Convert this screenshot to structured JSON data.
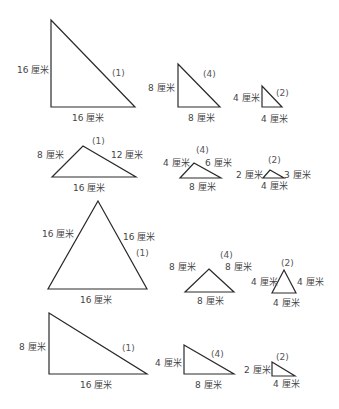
{
  "unit": "厘米",
  "rows": [
    {
      "name": "right-triangles-large",
      "triangles": [
        {
          "tag": "(1)",
          "points": "51,20 135,107 51,107",
          "labels": [
            {
              "text": "16 厘米",
              "x": 17,
              "y": 73
            },
            {
              "text": "16 厘米",
              "x": 72,
              "y": 121
            },
            {
              "text": "(1)",
              "x": 112,
              "y": 76,
              "kind": "tag"
            }
          ]
        },
        {
          "tag": "(4)",
          "points": "178,64 220,107 178,107",
          "labels": [
            {
              "text": "8 厘米",
              "x": 148,
              "y": 91
            },
            {
              "text": "8 厘米",
              "x": 188,
              "y": 121
            },
            {
              "text": "(4)",
              "x": 203,
              "y": 77,
              "kind": "tag"
            }
          ]
        },
        {
          "tag": "(2)",
          "points": "262,86 282,107 262,107",
          "labels": [
            {
              "text": "4 厘米",
              "x": 233,
              "y": 101
            },
            {
              "text": "4 厘米",
              "x": 261,
              "y": 122
            },
            {
              "text": "(2)",
              "x": 276,
              "y": 96,
              "kind": "tag"
            }
          ]
        }
      ]
    },
    {
      "name": "scalene-triangles",
      "triangles": [
        {
          "tag": "(1)",
          "points": "52,177 83,146 136,177",
          "labels": [
            {
              "text": "8 厘米",
              "x": 37,
              "y": 158
            },
            {
              "text": "12 厘米",
              "x": 111,
              "y": 158
            },
            {
              "text": "16 厘米",
              "x": 73,
              "y": 191
            },
            {
              "text": "(1)",
              "x": 92,
              "y": 144,
              "kind": "tag"
            }
          ]
        },
        {
          "tag": "(4)",
          "points": "180,178 194,163 221,178",
          "labels": [
            {
              "text": "4 厘米",
              "x": 163,
              "y": 166
            },
            {
              "text": "6 厘米",
              "x": 205,
              "y": 166
            },
            {
              "text": "8 厘米",
              "x": 189,
              "y": 190
            },
            {
              "text": "(4)",
              "x": 196,
              "y": 153,
              "kind": "tag"
            }
          ]
        },
        {
          "tag": "(2)",
          "points": "263,178 270,170 284,178",
          "labels": [
            {
              "text": "2 厘米",
              "x": 236,
              "y": 178
            },
            {
              "text": "3 厘米",
              "x": 284,
              "y": 178
            },
            {
              "text": "4 厘米",
              "x": 261,
              "y": 189
            },
            {
              "text": "(2)",
              "x": 268,
              "y": 163,
              "kind": "tag"
            }
          ]
        }
      ]
    },
    {
      "name": "equilateral-triangles",
      "triangles": [
        {
          "tag": "(1)",
          "points": "98,201 147,289 48,289",
          "labels": [
            {
              "text": "16 厘米",
              "x": 42,
              "y": 237
            },
            {
              "text": "16 厘米",
              "x": 123,
              "y": 240
            },
            {
              "text": "(1)",
              "x": 136,
              "y": 256,
              "kind": "tag"
            },
            {
              "text": "16 厘米",
              "x": 80,
              "y": 303
            }
          ]
        },
        {
          "tag": "(4)",
          "points": "209,269 234,292 185,292",
          "labels": [
            {
              "text": "8 厘米",
              "x": 169,
              "y": 270
            },
            {
              "text": "8 厘米",
              "x": 225,
              "y": 270
            },
            {
              "text": "8 厘米",
              "x": 197,
              "y": 304
            },
            {
              "text": "(4)",
              "x": 220,
              "y": 258,
              "kind": "tag"
            }
          ]
        },
        {
          "tag": "(2)",
          "points": "284,270 296,293 272,293",
          "labels": [
            {
              "text": "4 厘米",
              "x": 251,
              "y": 285
            },
            {
              "text": "4 厘米",
              "x": 297,
              "y": 285
            },
            {
              "text": "4 厘米",
              "x": 273,
              "y": 306
            },
            {
              "text": "(2)",
              "x": 281,
              "y": 266,
              "kind": "tag"
            }
          ]
        }
      ]
    },
    {
      "name": "right-triangles-wide",
      "triangles": [
        {
          "tag": "(1)",
          "points": "49,313 147,374 49,374",
          "labels": [
            {
              "text": "8 厘米",
              "x": 19,
              "y": 350
            },
            {
              "text": "16 厘米",
              "x": 80,
              "y": 388
            },
            {
              "text": "(1)",
              "x": 122,
              "y": 351,
              "kind": "tag"
            }
          ]
        },
        {
          "tag": "(4)",
          "points": "184,345 234,374 184,374",
          "labels": [
            {
              "text": "4 厘米",
              "x": 155,
              "y": 366
            },
            {
              "text": "8 厘米",
              "x": 195,
              "y": 388
            },
            {
              "text": "(4)",
              "x": 211,
              "y": 357,
              "kind": "tag"
            }
          ]
        },
        {
          "tag": "(2)",
          "points": "272,362 295,376 272,376",
          "labels": [
            {
              "text": "2 厘米",
              "x": 244,
              "y": 373
            },
            {
              "text": "4 厘米",
              "x": 273,
              "y": 387
            },
            {
              "text": "(2)",
              "x": 276,
              "y": 360,
              "kind": "tag"
            }
          ]
        }
      ]
    }
  ]
}
